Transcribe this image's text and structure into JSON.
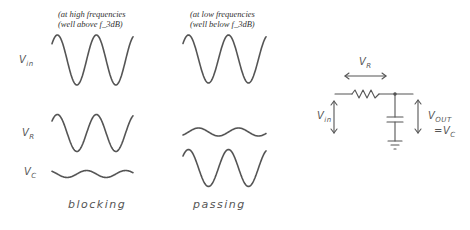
{
  "captions": {
    "high": {
      "line1": "(at high frequencies",
      "line2": "(well above f_3dB)"
    },
    "low": {
      "line1": "(at low frequencies",
      "line2": "(well below f_3dB)"
    }
  },
  "row_labels": {
    "vin": {
      "main": "V",
      "sub": "in"
    },
    "vr": {
      "main": "V",
      "sub": "R"
    },
    "vc": {
      "main": "V",
      "sub": "C"
    }
  },
  "column_labels": {
    "high": "blocking",
    "low": "passing"
  },
  "circuit": {
    "vr_label": {
      "main": "V",
      "sub": "R"
    },
    "vin_label": {
      "main": "V",
      "sub": "in"
    },
    "vout_label": {
      "main": "V",
      "sub": "OUT"
    },
    "vout_eq": {
      "prefix": "=V",
      "sub": "C"
    },
    "components": [
      "resistor",
      "capacitor",
      "ground"
    ]
  },
  "waveforms": {
    "high_frequency": {
      "vin": {
        "amplitude": "large",
        "phase": "starts mid, rises"
      },
      "vr": {
        "amplitude": "large"
      },
      "vc": {
        "amplitude": "small"
      }
    },
    "low_frequency": {
      "vin": {
        "amplitude": "large"
      },
      "vr": {
        "amplitude": "small"
      },
      "vc": {
        "amplitude": "large"
      }
    }
  },
  "colors": {
    "ink": "#555555",
    "caption": "#333333",
    "background": "#ffffff"
  }
}
